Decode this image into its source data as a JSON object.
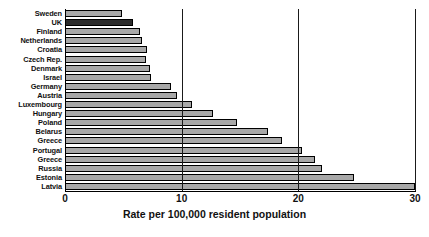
{
  "chart_data": {
    "type": "bar",
    "orientation": "horizontal",
    "title": "",
    "xlabel": "Rate per 100,000 resident population",
    "ylabel": "",
    "xlim": [
      0,
      30
    ],
    "xticks": [
      0,
      10,
      20,
      30
    ],
    "xtick_labels": [
      "0",
      "10",
      "20",
      "30"
    ],
    "grid": true,
    "grid_axis": "x",
    "legend": false,
    "categories": [
      "Sweden",
      "UK",
      "Finland",
      "Netherlands",
      "Croatia",
      "Czech Rep.",
      "Denmark",
      "Israel",
      "Germany",
      "Austria",
      "Luxembourg",
      "Hungary",
      "Poland",
      "Belarus",
      "Greece",
      "Portugal",
      "Greece",
      "Russia",
      "Estonia",
      "Latvia"
    ],
    "values": [
      4.9,
      5.8,
      6.4,
      6.6,
      7.0,
      6.9,
      7.3,
      7.4,
      9.1,
      9.6,
      10.9,
      12.7,
      14.7,
      17.4,
      18.6,
      20.3,
      21.4,
      22.0,
      24.8,
      30.0
    ],
    "highlight_category": "UK",
    "bar_color": "#a8a8a8",
    "highlight_color": "#2b2b2b",
    "bar_edge_color": "#000000"
  }
}
